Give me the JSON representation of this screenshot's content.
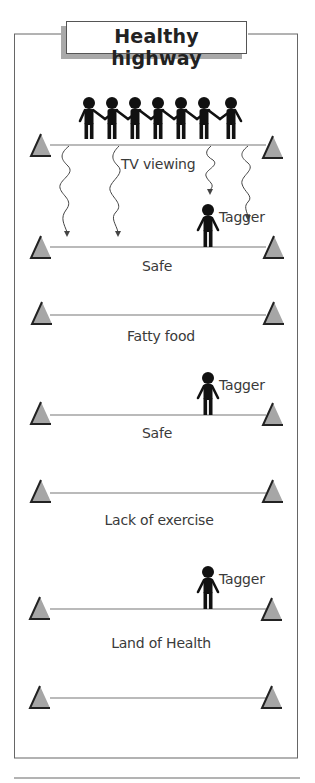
{
  "title": "Healthy highway",
  "colors": {
    "frame": "#666666",
    "line": "#777777",
    "triangle_fill": "#a6a6a6",
    "triangle_edge": "#222222",
    "figure": "#111111",
    "title_shadow": "#a9a9a9",
    "text": "#3a3a3a"
  },
  "figures": {
    "group_count": 7,
    "group_description": "people holding hands"
  },
  "arrows": {
    "count": 4,
    "style": "wavy downward arrows"
  },
  "labels": {
    "tv_viewing": "TV viewing",
    "safe_1": "Safe",
    "fatty_food": "Fatty food",
    "safe_2": "Safe",
    "lack_of_exercise": "Lack of exercise",
    "land_of_health": "Land of Health"
  },
  "taggers": [
    {
      "label": "Tagger"
    },
    {
      "label": "Tagger"
    },
    {
      "label": "Tagger"
    }
  ],
  "lanes": [
    {
      "id": "start-line",
      "label": "TV viewing"
    },
    {
      "id": "line-2",
      "label": "Safe"
    },
    {
      "id": "line-3",
      "label": "Fatty food"
    },
    {
      "id": "line-4",
      "label": "Safe"
    },
    {
      "id": "line-5",
      "label": "Lack of exercise"
    },
    {
      "id": "line-6",
      "label": "Land of Health"
    },
    {
      "id": "end-line",
      "label": ""
    }
  ]
}
